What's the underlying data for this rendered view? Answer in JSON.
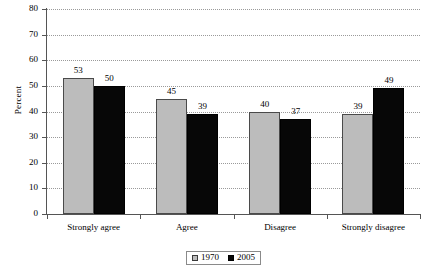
{
  "chart_data": {
    "type": "bar",
    "title": "",
    "subtitle": "",
    "xlabel": "",
    "ylabel": "Percent",
    "ylim": [
      0,
      80
    ],
    "ytick_step": 10,
    "yticks": [
      "0",
      "10",
      "20",
      "30",
      "40",
      "50",
      "60",
      "70",
      "80"
    ],
    "grid": true,
    "grid_style": "dotted horizontal",
    "legend_position": "bottom-center",
    "categories": [
      "Strongly agree",
      "Agree",
      "Disagree",
      "Strongly disagree"
    ],
    "series": [
      {
        "name": "1970",
        "color": "#bcbcbc",
        "values": [
          53,
          45,
          40,
          39
        ]
      },
      {
        "name": "2005",
        "color": "#070707",
        "values": [
          50,
          39,
          37,
          49
        ]
      }
    ],
    "data_labels": [
      [
        "53",
        "50"
      ],
      [
        "45",
        "39"
      ],
      [
        "40",
        "37"
      ],
      [
        "39",
        "49"
      ]
    ]
  },
  "legend": {
    "entries": [
      {
        "label": "1970",
        "swatch": "light-gray-square-marker"
      },
      {
        "label": "2005",
        "swatch": "black-square-marker"
      }
    ]
  },
  "colors": {
    "series_1970": "#bcbcbc",
    "series_2005": "#070707",
    "axis": "#555555",
    "gridline": "#9a9a9a",
    "background": "#ffffff",
    "text": "#000000"
  }
}
